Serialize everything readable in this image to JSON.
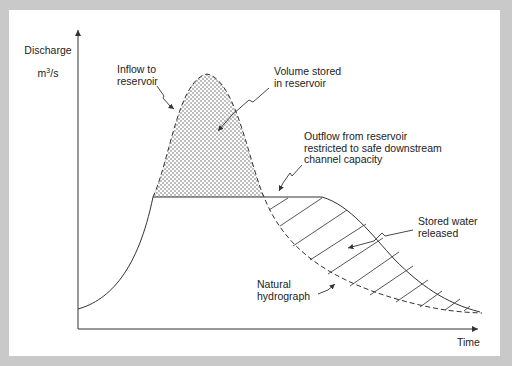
{
  "diagram": {
    "type": "flood-routing-hydrograph",
    "y_axis_label": {
      "line1": "Discharge",
      "unit_prefix": "m",
      "unit_sup": "3",
      "unit_suffix": "/s"
    },
    "x_axis_label": "Time",
    "annotations": {
      "inflow": "Inflow to\nreservoir",
      "volume_stored": "Volume stored\nin reservoir",
      "outflow": "Outflow from reservoir\nrestricted to safe downstream\nchannel capacity",
      "stored_released": "Stored water\nreleased",
      "natural": "Natural\nhydrograph"
    },
    "series": [
      {
        "name": "Natural hydrograph (inflow)",
        "style": "dashed"
      },
      {
        "name": "Regulated outflow",
        "style": "solid"
      }
    ],
    "regions": [
      {
        "name": "Volume stored in reservoir",
        "fill": "stipple"
      },
      {
        "name": "Stored water released",
        "fill": "hatch"
      }
    ],
    "colors": {
      "background": "#c9c9c9",
      "panel": "#ffffff",
      "ink": "#333333"
    }
  }
}
